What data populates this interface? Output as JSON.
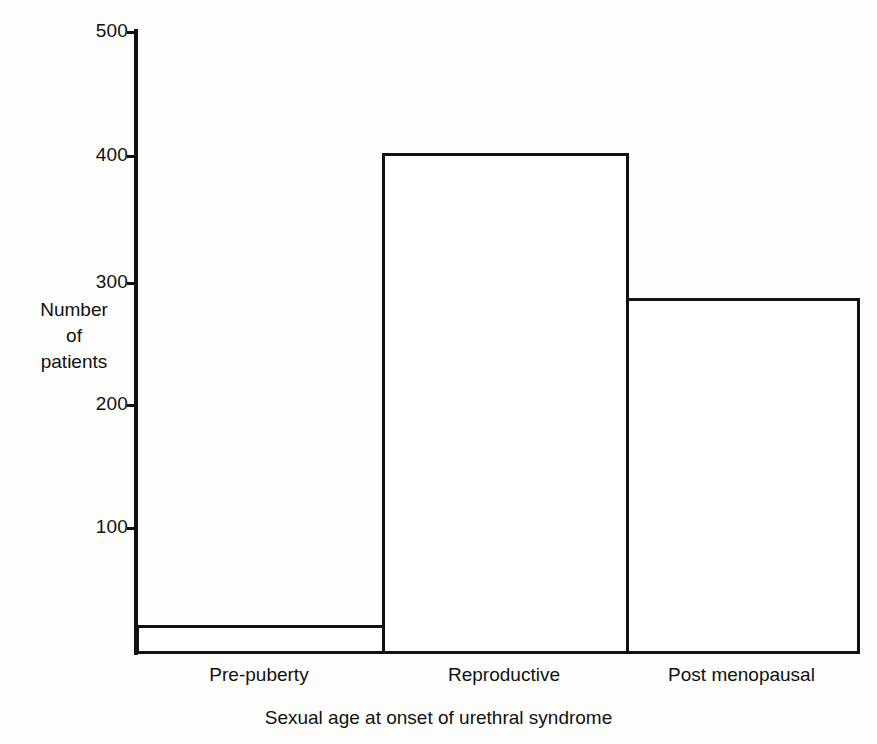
{
  "chart_data": {
    "type": "bar",
    "title": "",
    "subtitle": "",
    "xlabel": "Sexual age at onset of urethral syndrome",
    "ylabel": "Number of patients",
    "ylabel_lines": [
      "Number",
      "of",
      "patients"
    ],
    "categories": [
      "Pre-puberty",
      "Reproductive",
      "Post menopausal"
    ],
    "values": [
      21,
      402,
      285
    ],
    "ylim": [
      0,
      500
    ],
    "yticks": [
      100,
      200,
      300,
      400,
      500
    ],
    "ytick_labels": [
      "100",
      "200",
      "300",
      "400",
      "500"
    ],
    "grid": false,
    "legend": false,
    "bar_style": {
      "fill": "#ffffff",
      "outline": "#111111",
      "outline_width_px": 3,
      "gap_px": 0
    },
    "colors": {
      "background": "#fdfdfc",
      "axis": "#111111",
      "text": "#111111"
    }
  },
  "geometry": {
    "plot_left_px": 136,
    "plot_right_px": 857,
    "plot_top_px": 31,
    "baseline_px": 651,
    "bar_edges_px": [
      136,
      382,
      626,
      857
    ]
  }
}
